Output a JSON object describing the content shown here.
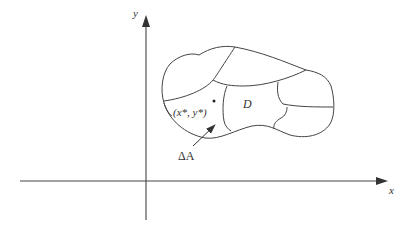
{
  "figure": {
    "colors": {
      "stroke": "#444444",
      "text": "#333333",
      "background": "#ffffff"
    }
  },
  "axes": {
    "x_label": "x",
    "y_label": "y"
  },
  "region": {
    "label": "D"
  },
  "sample_point": {
    "label": "(x*, y*)"
  },
  "subregion": {
    "label": "ΔA"
  }
}
